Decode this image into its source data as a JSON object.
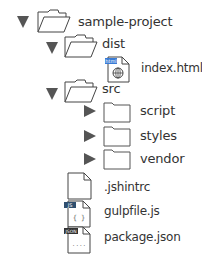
{
  "tree": {
    "root": {
      "label": "sample-project",
      "expanded": true,
      "icon": "open-folder-icon"
    },
    "dist": {
      "label": "dist",
      "expanded": true,
      "icon": "open-folder-icon"
    },
    "index_html": {
      "label": "index.html",
      "icon": "html-file-icon",
      "badge": "html"
    },
    "src": {
      "label": "src",
      "expanded": true,
      "icon": "open-folder-icon"
    },
    "script": {
      "label": "script",
      "expanded": false,
      "icon": "closed-folder-icon"
    },
    "styles": {
      "label": "styles",
      "expanded": false,
      "icon": "closed-folder-icon"
    },
    "vendor": {
      "label": "vendor",
      "expanded": false,
      "icon": "closed-folder-icon"
    },
    "jshintrc": {
      "label": ".jshintrc",
      "icon": "file-icon"
    },
    "gulpfile": {
      "label": "gulpfile.js",
      "icon": "js-file-icon",
      "badge": "JS"
    },
    "package_json": {
      "label": "package.json",
      "icon": "json-file-icon",
      "badge": "JSON"
    }
  },
  "colors": {
    "triangle": "#555555",
    "outline": "#444444",
    "html_badge": "#3a7bd5",
    "js_badge": "#2f4f6f",
    "json_badge": "#333333"
  }
}
